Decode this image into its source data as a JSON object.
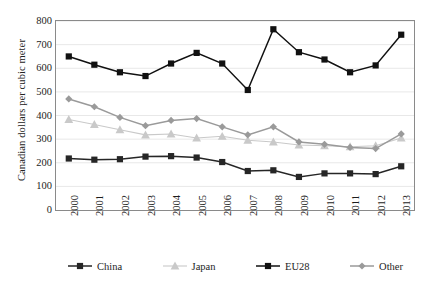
{
  "chart_data": {
    "type": "line",
    "title": "",
    "xlabel": "",
    "ylabel": "Canadian dollars per cubic meter",
    "ylim": [
      0,
      800
    ],
    "ytick_step": 100,
    "grid": true,
    "legend_position": "bottom",
    "categories": [
      "2000",
      "2001",
      "2002",
      "2003",
      "2004",
      "2005",
      "2006",
      "2007",
      "2008",
      "2009",
      "2010",
      "2011",
      "2012",
      "2013"
    ],
    "series": [
      {
        "name": "China",
        "color": "#262626",
        "marker": "square",
        "values": [
          218,
          213,
          215,
          226,
          228,
          222,
          203,
          165,
          168,
          140,
          155,
          155,
          152,
          185
        ]
      },
      {
        "name": "Japan",
        "color": "#c9c9c9",
        "marker": "triangle",
        "values": [
          383,
          362,
          340,
          318,
          322,
          305,
          312,
          295,
          288,
          275,
          272,
          268,
          272,
          305
        ]
      },
      {
        "name": "EU28",
        "color": "#111111",
        "marker": "square",
        "values": [
          650,
          615,
          583,
          567,
          620,
          665,
          620,
          508,
          765,
          668,
          637,
          583,
          612,
          742
        ]
      },
      {
        "name": "Other",
        "color": "#9a9a9a",
        "marker": "diamond",
        "values": [
          470,
          437,
          392,
          357,
          379,
          387,
          352,
          318,
          352,
          288,
          278,
          265,
          260,
          322
        ]
      }
    ],
    "ytick_labels": [
      "800",
      "700",
      "600",
      "500",
      "400",
      "300",
      "200",
      "100",
      "0"
    ]
  },
  "legend": {
    "items": [
      {
        "label": "China"
      },
      {
        "label": "Japan"
      },
      {
        "label": "EU28"
      },
      {
        "label": "Other"
      }
    ]
  }
}
